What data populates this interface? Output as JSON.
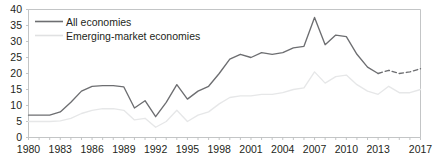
{
  "chart_data": {
    "type": "line",
    "title": "",
    "subtitle": "",
    "xlabel": "",
    "ylabel": "",
    "xlim": [
      1980,
      2017
    ],
    "ylim": [
      0,
      40
    ],
    "yticks": [
      0,
      5,
      10,
      15,
      20,
      25,
      30,
      35,
      40
    ],
    "xticks": [
      1980,
      1983,
      1986,
      1989,
      1992,
      1995,
      1998,
      2001,
      2004,
      2007,
      2010,
      2013,
      2017
    ],
    "grid": false,
    "legend_position": "top-left",
    "x": [
      1980,
      1981,
      1982,
      1983,
      1984,
      1985,
      1986,
      1987,
      1988,
      1989,
      1990,
      1991,
      1992,
      1993,
      1994,
      1995,
      1996,
      1997,
      1998,
      1999,
      2000,
      2001,
      2002,
      2003,
      2004,
      2005,
      2006,
      2007,
      2008,
      2009,
      2010,
      2011,
      2012,
      2013,
      2014,
      2015,
      2016,
      2017
    ],
    "series": [
      {
        "name": "All economies",
        "color": "#6d6e71",
        "style": "solid",
        "dashed_from": 2013,
        "values": [
          7.0,
          7.0,
          7.0,
          8.0,
          11.0,
          14.5,
          16.0,
          16.2,
          16.2,
          15.8,
          9.2,
          11.5,
          6.5,
          11.0,
          16.5,
          12.0,
          14.5,
          16.0,
          20.0,
          24.5,
          26.0,
          25.0,
          26.5,
          26.0,
          26.5,
          28.0,
          28.5,
          37.5,
          29.0,
          32.0,
          31.5,
          26.0,
          22.0,
          20.0,
          21.0,
          20.0,
          20.5,
          21.5
        ]
      },
      {
        "name": "Emerging-market economies",
        "color": "#e6e7e8",
        "style": "solid",
        "values": [
          5.0,
          5.0,
          5.0,
          5.2,
          6.0,
          7.5,
          8.5,
          9.0,
          9.0,
          8.5,
          5.5,
          6.0,
          3.2,
          5.0,
          8.5,
          5.0,
          7.0,
          8.0,
          10.5,
          12.5,
          13.0,
          13.0,
          13.5,
          13.5,
          14.0,
          15.0,
          15.5,
          20.5,
          17.0,
          19.0,
          19.5,
          16.5,
          14.5,
          13.5,
          16.0,
          14.0,
          14.0,
          15.0
        ]
      }
    ],
    "legend": [
      {
        "label": "All economies",
        "color": "#6d6e71"
      },
      {
        "label": "Emerging-market economies",
        "color": "#e0e1e2"
      }
    ]
  },
  "axis": {
    "y_labels": [
      "40",
      "35",
      "30",
      "25",
      "20",
      "15",
      "10",
      "5",
      "0"
    ],
    "x_labels": [
      "1980",
      "1983",
      "1986",
      "1989",
      "1992",
      "1995",
      "1998",
      "2001",
      "2004",
      "2007",
      "2010",
      "2013",
      "2017"
    ]
  },
  "colors": {
    "series_primary": "#6d6e71",
    "series_secondary": "#e3e4e5",
    "axis": "#bcbec0",
    "text": "#231f20"
  }
}
